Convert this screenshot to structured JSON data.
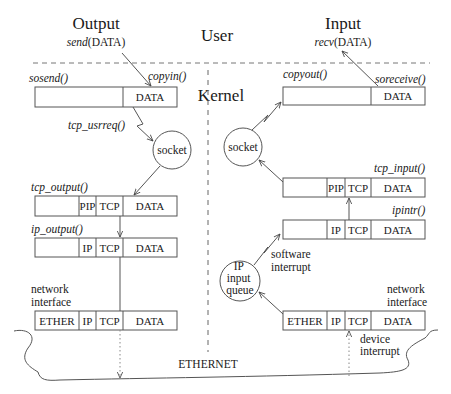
{
  "headers": {
    "output": "Output",
    "input": "Input",
    "user": "User",
    "kernel": "Kernel"
  },
  "calls": {
    "send": "send",
    "send_arg": "(DATA)",
    "recv": "recv",
    "recv_arg": "(DATA)",
    "copyin": "copyin()",
    "copyout": "copyout()",
    "sosend": "sosend()",
    "soreceive": "soreceive()",
    "tcp_usrreq": "tcp_usrreq()",
    "tcp_output": "tcp_output()",
    "ip_output": "ip_output()",
    "tcp_input": "tcp_input()",
    "ipintr": "ipintr()"
  },
  "nodes": {
    "socket_left": "socket",
    "socket_right": "socket",
    "ip_queue": [
      "IP",
      "input",
      "queue"
    ]
  },
  "labels": {
    "network_interface_left": [
      "network",
      "interface"
    ],
    "network_interface_right": [
      "network",
      "interface"
    ],
    "software_interrupt": [
      "software",
      "interrupt"
    ],
    "device_interrupt": [
      "device",
      "interrupt"
    ],
    "ethernet": "ETHERNET"
  },
  "packets": {
    "sosend_buffer": [
      "",
      "DATA"
    ],
    "tcp_output_packet": [
      "",
      "PIP",
      "TCP",
      "DATA"
    ],
    "ip_output_packet": [
      "",
      "IP",
      "TCP",
      "DATA"
    ],
    "ether_out_packet": [
      "ETHER",
      "IP",
      "TCP",
      "DATA"
    ],
    "soreceive_buffer": [
      "",
      "DATA"
    ],
    "tcp_input_packet": [
      "",
      "PIP",
      "TCP",
      "DATA"
    ],
    "ipintr_packet": [
      "",
      "IP",
      "TCP",
      "DATA"
    ],
    "ether_in_packet": [
      "ETHER",
      "IP",
      "TCP",
      "DATA"
    ]
  }
}
